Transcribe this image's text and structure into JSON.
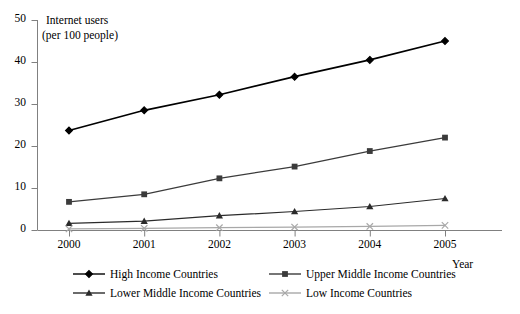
{
  "chart_data": {
    "type": "line",
    "title": "Internet users (per 100 people)",
    "title_line1": "Internet users",
    "title_line2": "(per 100 people)",
    "xlabel": "Year",
    "ylabel": "Internet users (per 100 people)",
    "categories": [
      "2000",
      "2001",
      "2002",
      "2003",
      "2004",
      "2005"
    ],
    "x": [
      2000,
      2001,
      2002,
      2003,
      2004,
      2005
    ],
    "xlim": [
      2000,
      2005
    ],
    "ylim": [
      0,
      50
    ],
    "yticks": [
      "0",
      "10",
      "20",
      "30",
      "40",
      "50"
    ],
    "ytick_values": [
      0,
      10,
      20,
      30,
      40,
      50
    ],
    "grid": false,
    "legend_position": "bottom",
    "series": [
      {
        "name": "High Income Countries",
        "marker": "diamond",
        "color": "#000000",
        "values": [
          23.7,
          28.5,
          32.2,
          36.5,
          40.5,
          45.0
        ]
      },
      {
        "name": "Upper Middle Income Countries",
        "marker": "square",
        "color": "#3b3b3b",
        "values": [
          6.7,
          8.5,
          12.3,
          15.1,
          18.8,
          22.0
        ]
      },
      {
        "name": "Lower Middle Income Countries",
        "marker": "triangle",
        "color": "#2b2b2b",
        "values": [
          1.6,
          2.1,
          3.4,
          4.4,
          5.6,
          7.5
        ]
      },
      {
        "name": "Low Income Countries",
        "marker": "cross",
        "color": "#a8a8a8",
        "values": [
          0.25,
          0.4,
          0.55,
          0.7,
          0.85,
          1.1
        ]
      }
    ]
  },
  "legend": {
    "items": [
      {
        "label": "High Income Countries",
        "marker": "diamond",
        "color": "#000000"
      },
      {
        "label": "Upper Middle Income Countries",
        "marker": "square",
        "color": "#3b3b3b"
      },
      {
        "label": "Lower Middle Income Countries",
        "marker": "triangle",
        "color": "#2b2b2b"
      },
      {
        "label": "Low Income Countries",
        "marker": "cross",
        "color": "#a8a8a8"
      }
    ]
  }
}
